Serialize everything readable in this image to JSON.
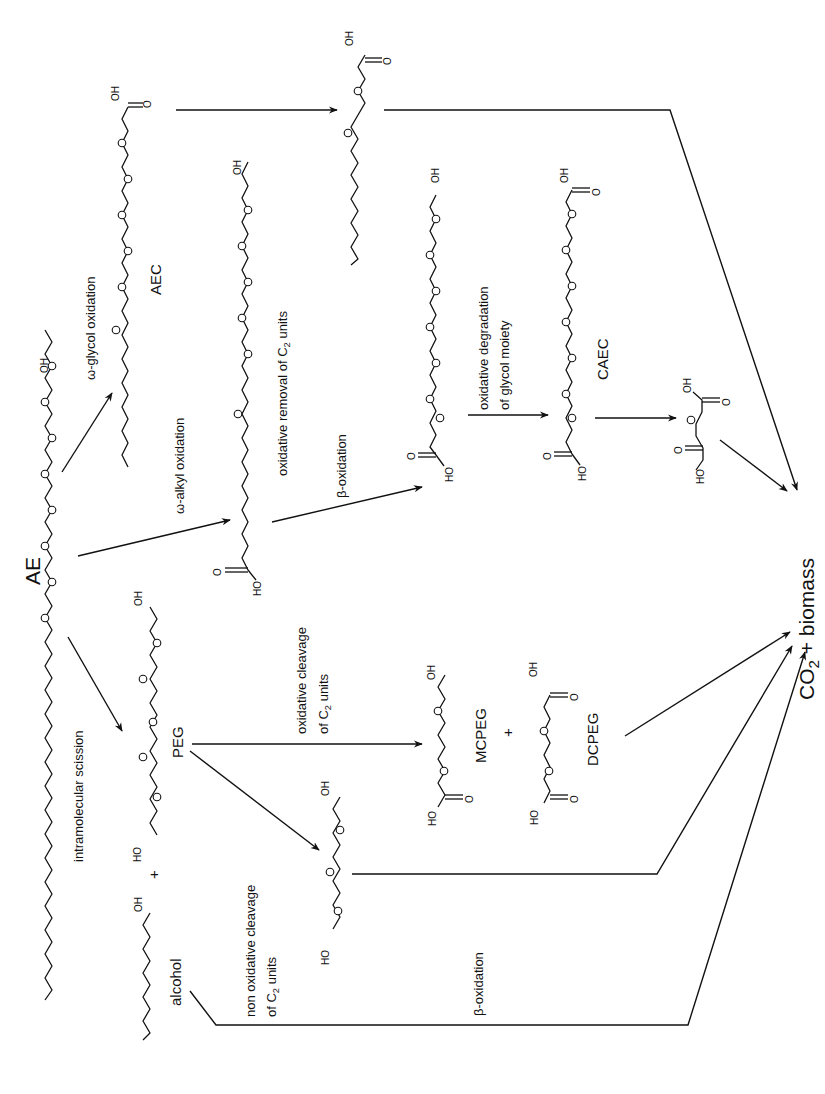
{
  "diagram": {
    "compounds": {
      "ae": "AE",
      "aec": "AEC",
      "caec": "CAEC",
      "peg": "PEG",
      "alcohol": "alcohol",
      "mcpeg": "MCPEG",
      "dcpeg": "DCPEG",
      "end_product_prefix": "CO",
      "end_product_sub": "2",
      "end_product_suffix": " + biomass",
      "plus": "+"
    },
    "atoms": {
      "oh": "OH",
      "ho": "HO",
      "o": "O"
    },
    "reactions": {
      "omega_glycol": "ω-glycol oxidation",
      "omega_alkyl": "ω-alkyl oxidation",
      "oxidative_removal_prefix": "oxidative removal of C",
      "oxidative_removal_sub": "2",
      "oxidative_removal_suffix": " units",
      "beta_oxidation_1": "β-oxidation",
      "oxidative_degradation_line1": "oxidative degradation",
      "oxidative_degradation_line2": "of glycol moiety",
      "intramolecular_scission": "intramolecular scission",
      "oxidative_cleavage_line1": "oxidative cleavage",
      "oxidative_cleavage_line2_prefix": "of C",
      "oxidative_cleavage_line2_sub": "2",
      "oxidative_cleavage_line2_suffix": " units",
      "non_oxidative_line1": "non oxidative cleavage",
      "non_oxidative_line2_prefix": "of C",
      "non_oxidative_line2_sub": "2",
      "non_oxidative_line2_suffix": " units",
      "beta_oxidation_2": "β-oxidation"
    }
  }
}
